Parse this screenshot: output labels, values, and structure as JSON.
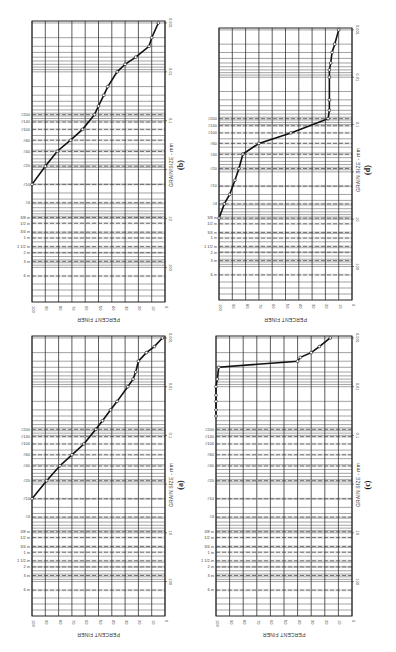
{
  "figure": {
    "orientation": "rotated 90° (landscape figure shown in portrait)",
    "axis_labels": {
      "x": "PERCENT FINER",
      "y": "GRAIN SIZE - mm"
    },
    "percent_ticks": [
      "100",
      "90",
      "80",
      "70",
      "60",
      "50",
      "40",
      "30",
      "20",
      "10",
      "0"
    ],
    "size_ticks": [
      "100",
      "10",
      "1",
      "0.1",
      "0.01",
      "0.001"
    ],
    "sieve_labels": [
      "6 in",
      "3 in",
      "2 in",
      "1 1/2 in",
      "1 in",
      "3/4 in",
      "1/2 in",
      "3/8 in",
      "#4",
      "#10",
      "#20",
      "#40",
      "#60",
      "#100",
      "#140",
      "#200"
    ]
  },
  "chart_data": [
    {
      "panel": "(a)",
      "type": "line",
      "title": "(a)",
      "xlabel": "GRAIN SIZE - mm",
      "ylabel": "PERCENT FINER",
      "xscale": "log",
      "xlim": [
        100,
        0.001
      ],
      "ylim": [
        0,
        100
      ],
      "grid": true,
      "x": [
        2.0,
        0.85,
        0.42,
        0.25,
        0.15,
        0.075,
        0.05,
        0.03,
        0.02,
        0.01,
        0.007,
        0.005,
        0.003,
        0.002,
        0.0015,
        0.001
      ],
      "y": [
        100,
        89,
        79,
        70,
        61,
        52,
        47,
        41,
        36,
        28,
        24,
        22,
        20,
        14,
        8,
        2
      ]
    },
    {
      "panel": "(b)",
      "type": "line",
      "title": "(b)",
      "xlabel": "GRAIN SIZE - mm",
      "ylabel": "PERCENT FINER",
      "xscale": "log",
      "xlim": [
        100,
        0.001
      ],
      "ylim": [
        0,
        100
      ],
      "grid": true,
      "x": [
        2.0,
        0.85,
        0.42,
        0.25,
        0.15,
        0.075,
        0.05,
        0.03,
        0.02,
        0.01,
        0.007,
        0.005,
        0.003,
        0.002,
        0.001
      ],
      "y": [
        100,
        90,
        81,
        71,
        62,
        53,
        50,
        46,
        43,
        36,
        30,
        22,
        12,
        10,
        5
      ]
    },
    {
      "panel": "(c)",
      "type": "line",
      "title": "(c)",
      "xlabel": "GRAIN SIZE - mm",
      "ylabel": "PERCENT FINER",
      "xscale": "log",
      "xlim": [
        100,
        0.001
      ],
      "ylim": [
        0,
        100
      ],
      "grid": true,
      "x": [
        0.04,
        0.03,
        0.02,
        0.015,
        0.01,
        0.007,
        0.004,
        0.003,
        0.0025,
        0.002,
        0.0015,
        0.001
      ],
      "y": [
        100,
        100,
        100,
        100,
        100,
        99,
        98,
        40,
        38,
        30,
        24,
        16
      ]
    },
    {
      "panel": "(d)",
      "type": "line",
      "title": "(d)",
      "xlabel": "GRAIN SIZE - mm",
      "ylabel": "PERCENT FINER",
      "xscale": "log",
      "xlim": [
        100,
        0.001
      ],
      "ylim": [
        0,
        100
      ],
      "grid": true,
      "x": [
        9.5,
        4.75,
        3.0,
        1.5,
        0.85,
        0.42,
        0.25,
        0.15,
        0.075,
        0.05,
        0.03,
        0.01,
        0.007,
        0.005,
        0.003,
        0.002,
        0.001
      ],
      "y": [
        100,
        96,
        92,
        88,
        85,
        82,
        70,
        46,
        18,
        17,
        17,
        17,
        17,
        16,
        15,
        13,
        10
      ]
    }
  ]
}
